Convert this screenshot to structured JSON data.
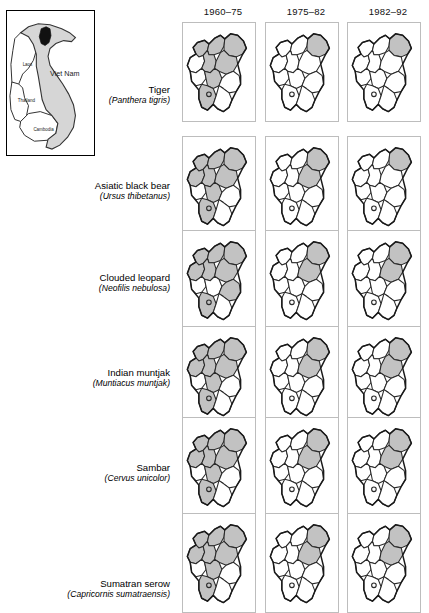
{
  "figure": {
    "inset": {
      "labels": [
        {
          "name": "Laos",
          "x": 16,
          "y": 56
        },
        {
          "name": "Viet Nam",
          "x": 44,
          "y": 66
        },
        {
          "name": "Thailand",
          "x": 11,
          "y": 92
        },
        {
          "name": "Cambodia",
          "x": 27,
          "y": 122
        }
      ],
      "study_area_name": "study-province",
      "vietnam_fill": "#d6d6d6",
      "study_fill": "#111111"
    },
    "columns": [
      {
        "label": "1960–75"
      },
      {
        "label": "1975–82"
      },
      {
        "label": "1982–92"
      }
    ],
    "rows": [
      {
        "common": "Tiger",
        "latin": "(Panthera tigris)"
      },
      {
        "common": "Asiatic black bear",
        "latin": "(Ursus thibetanus)"
      },
      {
        "common": "Clouded leopard",
        "latin": "(Neofilis nebulosa)"
      },
      {
        "common": "Indian muntjak",
        "latin": "(Muntiacus muntjak)"
      },
      {
        "common": "Sambar",
        "latin": "(Cervus unicolor)"
      },
      {
        "common": "Sumatran serow",
        "latin": "(Capricornis sumatraensis)"
      }
    ],
    "colors": {
      "present_fill": "#c2c2c2",
      "absent_fill": "#ffffff",
      "district_stroke": "#2a2a2a",
      "panel_border": "#bdbdbd"
    }
  },
  "chart_data": {
    "type": "map",
    "title": "",
    "legend": [
      {
        "label": "recorded present",
        "fill": "#c2c2c2"
      },
      {
        "label": "not recorded",
        "fill": "#ffffff"
      }
    ],
    "district_ids": [
      "d1",
      "d2",
      "d3",
      "d4",
      "d5",
      "d6",
      "d7",
      "d8",
      "d9",
      "d10",
      "d11"
    ],
    "categories": [
      "1960–75",
      "1975–82",
      "1982–92"
    ],
    "series": [
      {
        "name": "Tiger",
        "values": [
          7,
          1,
          1
        ],
        "presence": [
          [
            "d1",
            "d2",
            "d3",
            "d5",
            "d6",
            "d8",
            "d10"
          ],
          [
            "d3"
          ],
          [
            "d3"
          ]
        ]
      },
      {
        "name": "Asiatic black bear",
        "values": [
          8,
          2,
          1
        ],
        "presence": [
          [
            "d1",
            "d2",
            "d3",
            "d4",
            "d5",
            "d6",
            "d8",
            "d10"
          ],
          [
            "d3",
            "d6"
          ],
          [
            "d3"
          ]
        ]
      },
      {
        "name": "Clouded leopard",
        "values": [
          8,
          2,
          2
        ],
        "presence": [
          [
            "d1",
            "d2",
            "d3",
            "d4",
            "d5",
            "d6",
            "d9",
            "d10"
          ],
          [
            "d3",
            "d6"
          ],
          [
            "d3",
            "d6"
          ]
        ]
      },
      {
        "name": "Indian muntjak",
        "values": [
          8,
          2,
          2
        ],
        "presence": [
          [
            "d1",
            "d2",
            "d3",
            "d4",
            "d5",
            "d6",
            "d8",
            "d10"
          ],
          [
            "d3",
            "d6"
          ],
          [
            "d3",
            "d6"
          ]
        ]
      },
      {
        "name": "Sambar",
        "values": [
          8,
          2,
          2
        ],
        "presence": [
          [
            "d1",
            "d2",
            "d3",
            "d4",
            "d5",
            "d6",
            "d8",
            "d10"
          ],
          [
            "d3",
            "d6"
          ],
          [
            "d3",
            "d6"
          ]
        ]
      },
      {
        "name": "Sumatran serow",
        "values": [
          8,
          2,
          2
        ],
        "presence": [
          [
            "d1",
            "d2",
            "d3",
            "d4",
            "d5",
            "d6",
            "d8",
            "d10"
          ],
          [
            "d3",
            "d6"
          ],
          [
            "d3",
            "d6"
          ]
        ]
      }
    ]
  }
}
